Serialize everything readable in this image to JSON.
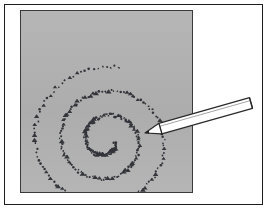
{
  "figure": {
    "title": "Hand-drawn spiral on a gray drawing surface with pencil",
    "caption": "",
    "label": ""
  },
  "frame": {
    "name": "outer-frame",
    "border_color": "#1d1d1d",
    "background_color": "#ffffff",
    "x": 4,
    "y": 4,
    "width": 259,
    "height": 201
  },
  "canvas": {
    "name": "drawing-surface",
    "fill_color": "#b2b2b2",
    "border_color": "#3a3a3a",
    "x": 20,
    "y": 10,
    "width": 173,
    "height": 183
  },
  "spiral": {
    "name": "stippled-spiral",
    "style": "dotted",
    "dot_color": "#33343a",
    "dot_count": 300,
    "turns": 2.75,
    "center_x": 85,
    "center_y": 130,
    "start_radius": 9,
    "end_radius": 78,
    "start_angle_deg": 10,
    "squash_y": 0.96,
    "end_point_x": 152,
    "end_point_y": 128
  },
  "pencil": {
    "name": "pencil",
    "body_color": "#ffffff",
    "outline_color": "#2a2a2a",
    "tip_color": "#ffffff",
    "tip_x": 145,
    "tip_y": 133,
    "tail_x": 251,
    "tail_y": 103,
    "thickness": 11,
    "tip_length": 16
  }
}
